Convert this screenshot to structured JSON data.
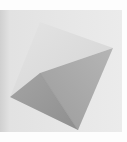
{
  "image": {
    "subject": "grayscale 3D polyhedron (tetrahedron) rendering",
    "width": 127,
    "height": 142,
    "colors": {
      "page_white": "#fdfdfd",
      "background": "#e6e6e6",
      "left_strip": "#d6d6d6",
      "top_face": "#dcdcdc",
      "left_face": "#9b9b9b",
      "right_face": "#a8a8a8",
      "ridge": "#8e8e8e"
    },
    "vertices": {
      "apex_back": [
        40,
        22
      ],
      "right": [
        113,
        48
      ],
      "left": [
        10,
        97
      ],
      "ridge_inner": [
        40,
        73
      ],
      "bottom": [
        78,
        130
      ]
    }
  }
}
